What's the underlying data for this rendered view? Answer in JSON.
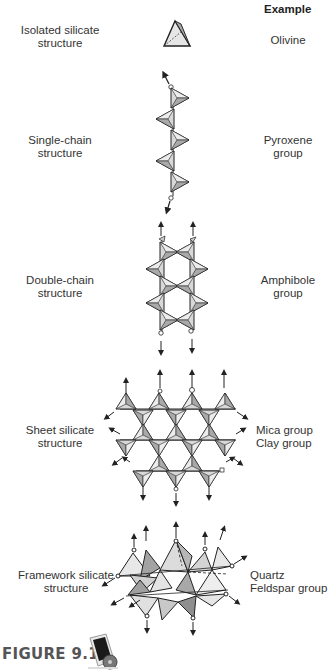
{
  "header": {
    "example_label": "Example"
  },
  "rows": [
    {
      "structure": [
        "Isolated silicate",
        "structure"
      ],
      "example": [
        "Olivine"
      ]
    },
    {
      "structure": [
        "Single-chain",
        "structure"
      ],
      "example": [
        "Pyroxene",
        "group"
      ]
    },
    {
      "structure": [
        "Double-chain",
        "structure"
      ],
      "example": [
        "Amphibole",
        "group"
      ]
    },
    {
      "structure": [
        "Sheet silicate",
        "structure"
      ],
      "example": [
        "Mica group",
        "Clay group"
      ]
    },
    {
      "structure": [
        "Framework silicate",
        "structure"
      ],
      "example": [
        "Quartz",
        "Feldspar group"
      ]
    }
  ],
  "caption": "FIGURE 9.12",
  "colors": {
    "tetra_fill_light": "#e6e6e6",
    "tetra_fill_dark": "#a8a8a8",
    "line": "#222222"
  }
}
